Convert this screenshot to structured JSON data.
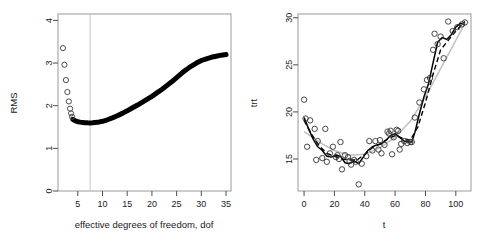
{
  "figure": {
    "background_color": "#ffffff",
    "panel_count": 2
  },
  "chart_data": [
    {
      "type": "line",
      "panel": "left",
      "title": "",
      "xlabel": "effective degrees of freedom, dof",
      "ylabel": "RMS",
      "xlim": [
        1,
        36
      ],
      "ylim": [
        0,
        4.15
      ],
      "xticks": [
        5,
        10,
        15,
        20,
        25,
        30,
        35
      ],
      "yticks": [
        0,
        1,
        2,
        3,
        4
      ],
      "grid": false,
      "legend": "none",
      "annotations": [
        {
          "name": "minimum-reference-line",
          "type": "vline",
          "x": 7.5,
          "color": "#c8c8c8"
        }
      ],
      "series": [
        {
          "name": "RMS open circles (low dof)",
          "marker": "open-circle",
          "color": "#4d4d4d",
          "x": [
            2.0,
            2.3,
            2.6,
            2.9,
            3.2,
            3.45,
            3.65,
            3.85
          ],
          "values": [
            3.35,
            2.96,
            2.6,
            2.32,
            2.1,
            1.93,
            1.82,
            1.74
          ]
        },
        {
          "name": "RMS curve (dense points)",
          "marker": "filled-band",
          "color": "#000000",
          "x": [
            4.0,
            4.5,
            5.0,
            5.5,
            6.0,
            6.5,
            7.0,
            7.5,
            8.0,
            9.0,
            10.0,
            11.0,
            12.0,
            13.0,
            14.0,
            15.0,
            16.0,
            17.0,
            18.0,
            19.0,
            20.0,
            21.0,
            22.0,
            23.0,
            24.0,
            25.0,
            26.0,
            27.0,
            28.0,
            29.0,
            30.0,
            31.0,
            32.0,
            33.0,
            34.0,
            35.0
          ],
          "values": [
            1.68,
            1.645,
            1.625,
            1.615,
            1.608,
            1.602,
            1.598,
            1.596,
            1.598,
            1.61,
            1.635,
            1.67,
            1.715,
            1.765,
            1.82,
            1.88,
            1.945,
            2.01,
            2.08,
            2.15,
            2.22,
            2.3,
            2.38,
            2.47,
            2.56,
            2.66,
            2.76,
            2.85,
            2.93,
            3.0,
            3.06,
            3.1,
            3.135,
            3.16,
            3.185,
            3.2
          ]
        }
      ]
    },
    {
      "type": "scatter",
      "panel": "right",
      "title": "",
      "xlabel": "t",
      "ylabel": "trt",
      "xlim": [
        -4,
        110
      ],
      "ylim": [
        11.6,
        30.4
      ],
      "xticks": [
        0,
        20,
        40,
        60,
        80,
        100
      ],
      "yticks": [
        15,
        20,
        25,
        30
      ],
      "grid": false,
      "legend": "none",
      "points": {
        "name": "observed trt",
        "marker": "open-circle",
        "color": "#333333",
        "x": [
          0,
          1,
          2,
          4,
          7,
          8,
          9,
          12,
          14,
          15,
          17,
          19,
          21,
          22,
          23,
          24,
          25,
          27,
          29,
          30,
          31,
          33,
          34,
          36,
          38,
          41,
          43,
          45,
          47,
          49,
          50,
          51,
          53,
          55,
          56,
          57,
          58,
          59,
          61,
          62,
          63,
          64,
          66,
          68,
          70,
          71,
          73,
          76,
          79,
          81,
          83,
          85,
          86,
          88,
          90,
          92,
          95,
          98,
          101,
          104,
          106
        ],
        "y": [
          21.3,
          19.3,
          16.3,
          19.1,
          18.2,
          14.9,
          16.9,
          15.1,
          18.2,
          14.7,
          15.6,
          16.3,
          15.2,
          15.4,
          15.0,
          16.8,
          13.9,
          15.4,
          15.2,
          14.8,
          14.4,
          14.9,
          14.7,
          12.3,
          14.5,
          15.3,
          16.9,
          15.9,
          16.9,
          16.0,
          17.0,
          15.6,
          16.5,
          17.9,
          17.7,
          18.0,
          15.5,
          17.3,
          18.1,
          18.0,
          16.0,
          16.6,
          16.9,
          16.7,
          16.8,
          16.8,
          19.4,
          21.0,
          22.4,
          23.4,
          23.6,
          26.6,
          28.3,
          27.2,
          28.0,
          25.7,
          29.6,
          28.6,
          29.0,
          29.3,
          29.5
        ]
      },
      "series": [
        {
          "name": "smoothing spline fit (solid)",
          "style": "solid",
          "color": "#000000",
          "x": [
            0,
            3,
            6,
            9,
            12,
            15,
            18,
            21,
            24,
            27,
            30,
            33,
            36,
            39,
            42,
            45,
            48,
            51,
            54,
            57,
            60,
            63,
            66,
            69,
            71,
            73,
            76,
            79,
            82,
            85,
            88,
            91,
            94,
            97,
            100,
            103,
            106
          ],
          "values": [
            19.4,
            18.2,
            17.1,
            16.3,
            15.9,
            15.3,
            15.2,
            15.4,
            15.3,
            14.6,
            14.5,
            14.8,
            14.5,
            15.2,
            15.9,
            16.3,
            16.5,
            16.6,
            17.0,
            17.5,
            17.7,
            17.3,
            16.9,
            16.8,
            16.8,
            17.8,
            19.8,
            21.6,
            23.0,
            25.2,
            27.4,
            27.9,
            27.7,
            28.2,
            29.0,
            29.4,
            29.3
          ]
        },
        {
          "name": "alternative smoother (dashed)",
          "style": "dashed",
          "color": "#000000",
          "x": [
            0,
            5,
            10,
            15,
            20,
            25,
            30,
            35,
            40,
            45,
            50,
            55,
            60,
            65,
            70,
            75,
            80,
            85,
            90,
            95,
            100,
            106
          ],
          "values": [
            19.1,
            17.6,
            16.4,
            15.6,
            15.3,
            15.0,
            14.9,
            14.9,
            15.5,
            16.2,
            16.6,
            17.1,
            17.5,
            17.2,
            17.0,
            18.4,
            21.0,
            24.0,
            26.6,
            27.6,
            28.6,
            29.6
          ]
        },
        {
          "name": "low-dof smoother (gray)",
          "style": "solid",
          "color": "#bebebe",
          "x": [
            0,
            10,
            20,
            30,
            40,
            50,
            60,
            70,
            80,
            90,
            100,
            106
          ],
          "values": [
            17.9,
            16.8,
            15.9,
            15.4,
            15.5,
            16.2,
            17.3,
            19.0,
            21.6,
            24.6,
            27.6,
            29.4
          ]
        }
      ]
    }
  ]
}
